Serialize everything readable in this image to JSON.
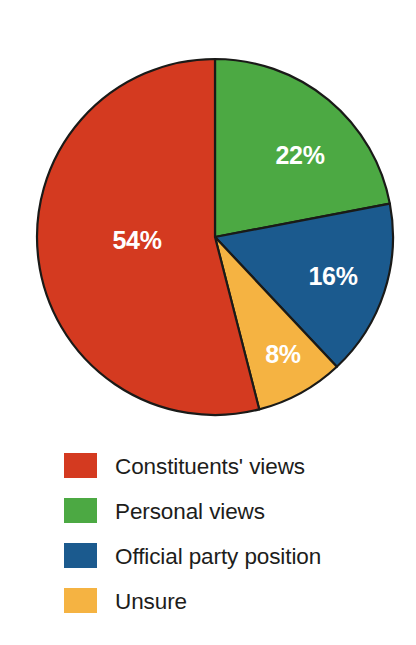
{
  "chart_data": {
    "type": "pie",
    "title": "",
    "subtitle": "",
    "xlabel": "",
    "ylabel": "",
    "grid": false,
    "legend_position": "bottom-left",
    "start_angle_deg": 0,
    "direction": "clockwise",
    "categories": [
      "Personal views",
      "Official party position",
      "Unsure",
      "Constituents' views"
    ],
    "values": [
      22,
      16,
      8,
      54
    ],
    "value_unit": "%",
    "slices": [
      {
        "label": "Personal views",
        "value": 22,
        "value_label": "22%",
        "color": "#4CA943",
        "start_deg": 0,
        "end_deg": 79.2,
        "label_color": "#ffffff"
      },
      {
        "label": "Official party position",
        "value": 16,
        "value_label": "16%",
        "color": "#1B5A8E",
        "start_deg": 79.2,
        "end_deg": 136.8,
        "label_color": "#ffffff"
      },
      {
        "label": "Unsure",
        "value": 8,
        "value_label": "8%",
        "color": "#F5B342",
        "start_deg": 136.8,
        "end_deg": 165.6,
        "label_color": "#ffffff"
      },
      {
        "label": "Constituents' views",
        "value": 54,
        "value_label": "54%",
        "color": "#D43A20",
        "start_deg": 165.6,
        "end_deg": 360,
        "label_color": "#ffffff"
      }
    ],
    "legend": [
      {
        "label": "Constituents' views",
        "color": "#D43A20"
      },
      {
        "label": "Personal views",
        "color": "#4CA943"
      },
      {
        "label": "Official party position",
        "color": "#1B5A8E"
      },
      {
        "label": "Unsure",
        "color": "#F5B342"
      }
    ]
  },
  "pie_labels": {
    "green": "22%",
    "blue": "16%",
    "orange": "8%",
    "red": "54%"
  },
  "legend_items": {
    "item0": "Constituents' views",
    "item1": "Personal views",
    "item2": "Official party position",
    "item3": "Unsure"
  },
  "colors": {
    "red": "#D43A20",
    "green": "#4CA943",
    "blue": "#1B5A8E",
    "orange": "#F5B342",
    "outline": "#1a1a18",
    "text": "#1d1d1b",
    "label_text": "#ffffff",
    "background": "#ffffff"
  }
}
